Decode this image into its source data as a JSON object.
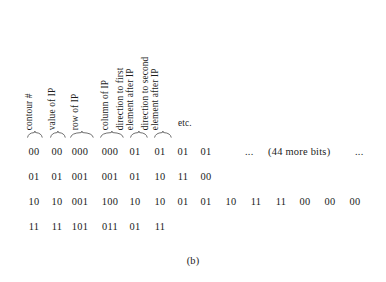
{
  "figure": {
    "caption": "(b)",
    "colors": {
      "background": "#ffffff",
      "text": "#1b1b1b",
      "brace": "#4a4a4a"
    }
  },
  "headers": [
    {
      "id": "contour-number",
      "lines": [
        "contour #"
      ],
      "x": 34,
      "rotated": true
    },
    {
      "id": "value-of-ip",
      "lines": [
        "value of IP"
      ],
      "x": 57,
      "rotated": true
    },
    {
      "id": "row-of-ip",
      "lines": [
        "row of IP"
      ],
      "x": 80,
      "rotated": true
    },
    {
      "id": "column-of-ip",
      "lines": [
        "column of IP"
      ],
      "x": 110,
      "rotated": true
    },
    {
      "id": "direction-first-element",
      "lines": [
        "direction to first",
        "element after IP"
      ],
      "x": 135,
      "rotated": true
    },
    {
      "id": "direction-second-element",
      "lines": [
        "direction to second",
        "element after IP"
      ],
      "x": 160,
      "rotated": true
    },
    {
      "id": "etcetera",
      "lines": [
        "etc."
      ],
      "x": 178,
      "rotated": false
    }
  ],
  "braces": [
    {
      "id": "brace-contour-number",
      "x": 27,
      "width": 16
    },
    {
      "x": 50,
      "width": 16,
      "id": "brace-value-of-ip"
    },
    {
      "x": 70,
      "width": 24,
      "id": "brace-row-of-ip"
    },
    {
      "x": 100,
      "width": 24,
      "id": "brace-column-of-ip"
    },
    {
      "x": 130,
      "width": 18,
      "id": "brace-direction-first"
    },
    {
      "x": 154,
      "width": 18,
      "id": "brace-direction-second"
    }
  ],
  "chart_data": {
    "type": "table",
    "title": "(b)",
    "column_headers": [
      "contour #",
      "value of IP",
      "row of IP",
      "column of IP",
      "direction to first element after IP",
      "direction to second element after IP",
      "etc."
    ],
    "rows": [
      {
        "id": "row-0",
        "cells": [
          "00",
          "00",
          "000",
          "000",
          "01",
          "01",
          "01",
          "01"
        ],
        "trailing_notes": [
          "...",
          "(44 more bits)",
          "..."
        ]
      },
      {
        "id": "row-1",
        "cells": [
          "01",
          "01",
          "001",
          "001",
          "01",
          "10",
          "11",
          "00"
        ],
        "trailing_notes": []
      },
      {
        "id": "row-2",
        "cells": [
          "10",
          "10",
          "001",
          "100",
          "10",
          "10",
          "01",
          "01",
          "10",
          "11",
          "11",
          "00",
          "00",
          "00"
        ],
        "trailing_notes": []
      },
      {
        "id": "row-3",
        "cells": [
          "11",
          "11",
          "101",
          "011",
          "01",
          "11"
        ],
        "trailing_notes": []
      }
    ]
  },
  "layout": {
    "cell_x": [
      34,
      57,
      80,
      110,
      135,
      160,
      183,
      206,
      231,
      256,
      281,
      305,
      330,
      355
    ],
    "row_y": [
      4,
      29,
      54,
      79
    ],
    "note_x": [
      245,
      268,
      355
    ]
  }
}
